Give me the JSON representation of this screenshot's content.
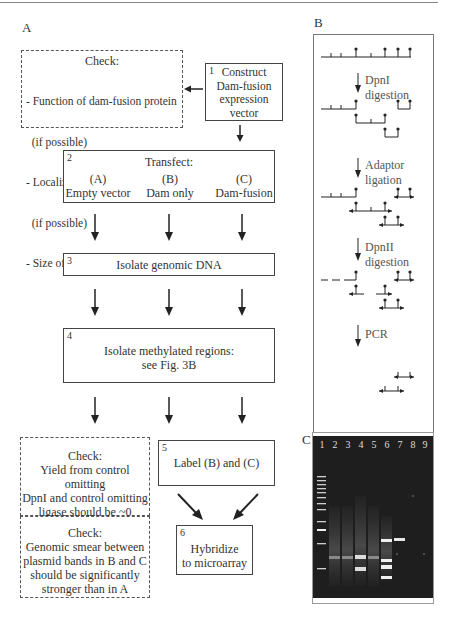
{
  "panels": {
    "A": {
      "label": "A"
    },
    "B": {
      "label": "B"
    },
    "C": {
      "label": "C"
    }
  },
  "flow": {
    "step1": {
      "num": "1",
      "lines": [
        "Construct",
        "Dam-fusion",
        "expression",
        "vector"
      ]
    },
    "check1": {
      "title": "Check:",
      "items": [
        "- Function of dam-fusion protein",
        "  (if possible)",
        "- Localization of fusion protein",
        "  (if possible)",
        "- Size of fusion protein"
      ]
    },
    "step2": {
      "num": "2",
      "title": "Transfect:",
      "columns": [
        {
          "id": "(A)",
          "label": "Empty vector"
        },
        {
          "id": "(B)",
          "label": "Dam only"
        },
        {
          "id": "(C)",
          "label": "Dam-fusion"
        }
      ]
    },
    "step3": {
      "num": "3",
      "text": "Isolate genomic DNA"
    },
    "step4": {
      "num": "4",
      "lines": [
        "Isolate methylated regions:",
        "see Fig. 3B"
      ]
    },
    "step5": {
      "num": "5",
      "text": "Label (B) and (C)"
    },
    "step6": {
      "num": "6",
      "lines": [
        "Hybridize",
        "to microarray"
      ]
    },
    "check2": {
      "title": "Check:",
      "lines": [
        "Yield from control omitting",
        "DpnI and control omitting",
        "ligase should be ~0"
      ]
    },
    "check3": {
      "title": "Check:",
      "lines": [
        "Genomic smear between",
        "plasmid bands in B and C",
        "should be significantly",
        "stronger than in A"
      ]
    }
  },
  "schematic": {
    "steps": [
      "DpnI digestion",
      "Adaptor ligation",
      "DpnII digestion",
      "PCR"
    ]
  },
  "gel": {
    "lanes": [
      "1",
      "2",
      "3",
      "4",
      "5",
      "6",
      "7",
      "8",
      "9"
    ],
    "background": "#1e1e1e"
  }
}
